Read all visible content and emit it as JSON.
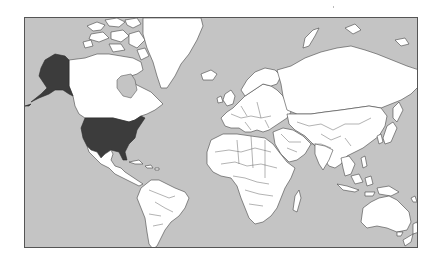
{
  "map": {
    "type": "world-choropleth",
    "projection": "mercator",
    "colors": {
      "ocean": "#c4c4c4",
      "land": "#ffffff",
      "highlight": "#3c3c3c",
      "border": "#444444",
      "frame": "#555555"
    },
    "highlighted_regions": [
      {
        "name": "United States (contiguous)",
        "color": "#3c3c3c"
      },
      {
        "name": "Alaska",
        "color": "#3c3c3c"
      }
    ],
    "regions": [
      "North America",
      "Greenland",
      "Canadian Arctic Archipelago",
      "Central America",
      "Caribbean",
      "South America",
      "Europe",
      "Iceland",
      "Africa",
      "Madagascar",
      "Middle East",
      "Russia",
      "Central Asia",
      "South Asia",
      "East Asia",
      "Japan",
      "Southeast Asia",
      "Indonesia",
      "Australia",
      "New Zealand",
      "Papua New Guinea"
    ]
  }
}
